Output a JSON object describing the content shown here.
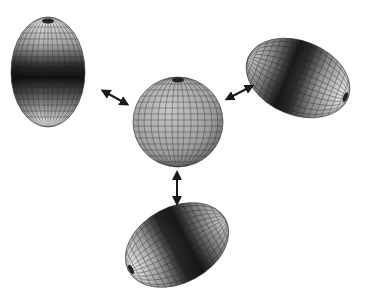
{
  "diagram": {
    "center": {
      "shape": "sphere",
      "cx": 178,
      "cy": 122,
      "rx": 45,
      "ry": 45
    },
    "ellipsoids": [
      {
        "name": "vertical-prolate",
        "cx": 48,
        "cy": 72,
        "rx": 37,
        "ry": 55,
        "rotation": 0
      },
      {
        "name": "upper-right-prolate",
        "cx": 298,
        "cy": 78,
        "rx": 54,
        "ry": 37,
        "rotation": 22
      },
      {
        "name": "bottom-prolate",
        "cx": 177,
        "cy": 245,
        "rx": 55,
        "ry": 38,
        "rotation": -28
      }
    ],
    "arrows": [
      {
        "name": "left-arrow",
        "x1": 103,
        "y1": 91,
        "x2": 126,
        "y2": 103
      },
      {
        "name": "right-arrow",
        "x1": 228,
        "y1": 98,
        "x2": 250,
        "y2": 86
      },
      {
        "name": "down-arrow",
        "x1": 177,
        "y1": 174,
        "x2": 177,
        "y2": 202
      }
    ],
    "colors": {
      "background": "#ffffff",
      "ink": "#1a1a1a",
      "light": "#f2f2f2",
      "mid": "#9a9a9a",
      "dark": "#151515"
    }
  }
}
